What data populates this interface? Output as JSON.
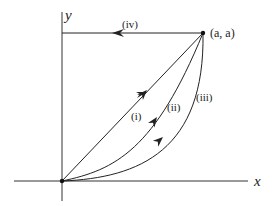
{
  "diagram": {
    "type": "line-integral-paths",
    "axes": {
      "x_label": "x",
      "y_label": "y"
    },
    "points": {
      "origin": {
        "label": ""
      },
      "endpoint": {
        "label": "(a, a)"
      }
    },
    "paths": [
      {
        "id": "i",
        "label": "(i)",
        "shape": "straight line from origin to (a, a)"
      },
      {
        "id": "ii",
        "label": "(ii)",
        "shape": "curve from origin to (a, a)"
      },
      {
        "id": "iii",
        "label": "(iii)",
        "shape": "more strongly curved path from origin to (a, a)"
      },
      {
        "id": "iv",
        "label": "(iv)",
        "shape": "horizontal line from (a, a) leftward to the y-axis"
      }
    ],
    "colors": {
      "stroke": "#222222",
      "background": "#ffffff"
    }
  }
}
